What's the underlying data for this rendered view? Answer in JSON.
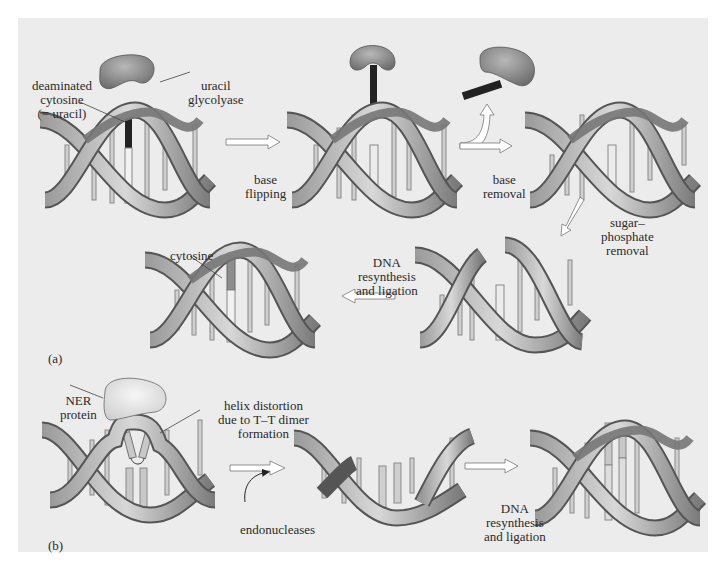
{
  "figure": {
    "panel_a": {
      "label": "(a)",
      "steps": [
        {
          "id": "a1",
          "name": "damaged-helix"
        },
        {
          "id": "a2",
          "name": "flipped-base-helix"
        },
        {
          "id": "a3",
          "name": "base-removed-helix"
        },
        {
          "id": "a4",
          "name": "backbone-gap-helix"
        },
        {
          "id": "a5",
          "name": "repaired-helix"
        }
      ],
      "labels": {
        "deaminated_1": "deaminated",
        "deaminated_2": "cytosine",
        "deaminated_3": "(= uracil)",
        "glycolyase_1": "uracil",
        "glycolyase_2": "glycolyase",
        "cytosine": "cytosine"
      },
      "arrows": {
        "flip_1": "base",
        "flip_2": "flipping",
        "removal_1": "base",
        "removal_2": "removal",
        "sugar_1": "sugar–",
        "sugar_2": "phosphate",
        "sugar_3": "removal",
        "resynth_1": "DNA",
        "resynth_2": "resynthesis",
        "resynth_3": "and ligation"
      }
    },
    "panel_b": {
      "label": "(b)",
      "labels": {
        "ner_1": "NER",
        "ner_2": "protein",
        "helix_1": "helix distortion",
        "helix_2": "due to T–T dimer",
        "helix_3": "formation",
        "endo": "endonucleases"
      },
      "arrows": {
        "resynth_1": "DNA",
        "resynth_2": "resynthesis",
        "resynth_3": "and ligation"
      }
    },
    "colors": {
      "background": "#ececec",
      "ribbon_light": "#d4d4d4",
      "ribbon_dark": "#5a5a5a",
      "protein": "#8a8a8a",
      "ner_protein": "#e0e0e0",
      "uracil": "#222222",
      "bar": "#c8c8c8"
    }
  }
}
